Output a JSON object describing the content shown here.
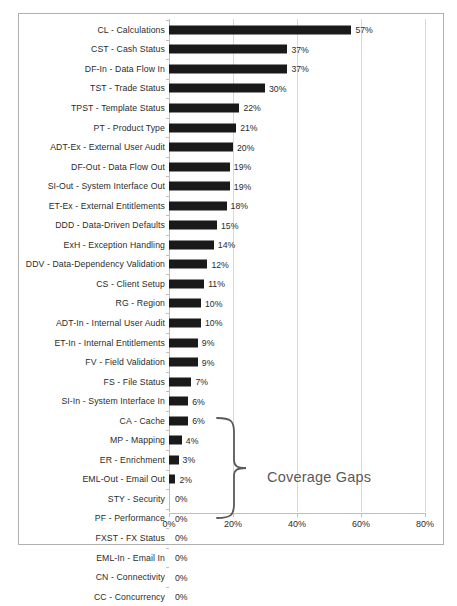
{
  "chart_data": {
    "type": "bar",
    "orientation": "horizontal",
    "title": "",
    "xlabel": "",
    "ylabel": "",
    "xlim": [
      0,
      80
    ],
    "grid": true,
    "legend": false,
    "unit": "%",
    "categories": [
      "CL - Calculations",
      "CST - Cash Status",
      "DF-In - Data Flow In",
      "TST - Trade Status",
      "TPST - Template Status",
      "PT - Product Type",
      "ADT-Ex - External User Audit",
      "DF-Out - Data Flow Out",
      "SI-Out - System Interface Out",
      "ET-Ex - External Entitlements",
      "DDD - Data-Driven Defaults",
      "ExH - Exception Handling",
      "DDV - Data-Dependency Validation",
      "CS - Client Setup",
      "RG - Region",
      "ADT-In - Internal User Audit",
      "ET-In - Internal Entitlements",
      "FV - Field Validation",
      "FS - File Status",
      "SI-In - System Interface In",
      "CA - Cache",
      "MP - Mapping",
      "ER - Enrichment",
      "EML-Out - Email Out",
      "STY - Security",
      "PF - Performance",
      "FXST - FX Status",
      "EML-In - Email In",
      "CN - Connectivity",
      "CC - Concurrency"
    ],
    "values": [
      57,
      37,
      37,
      30,
      22,
      21,
      20,
      19,
      19,
      18,
      15,
      14,
      12,
      11,
      10,
      10,
      9,
      9,
      7,
      6,
      6,
      4,
      3,
      2,
      0,
      0,
      0,
      0,
      0,
      0
    ],
    "data_labels": [
      "57%",
      "37%",
      "37%",
      "30%",
      "22%",
      "21%",
      "20%",
      "19%",
      "19%",
      "18%",
      "15%",
      "14%",
      "12%",
      "11%",
      "10%",
      "10%",
      "9%",
      "9%",
      "7%",
      "6%",
      "6%",
      "4%",
      "3%",
      "2%",
      "0%",
      "0%",
      "0%",
      "0%",
      "0%",
      "0%"
    ],
    "xticks": [
      0,
      20,
      40,
      60,
      80
    ],
    "xtick_labels": [
      "0%",
      "20%",
      "40%",
      "60%",
      "80%"
    ],
    "annotations": [
      {
        "text": "Coverage Gaps",
        "kind": "brace-callout",
        "covers_categories": [
          "STY - Security",
          "PF - Performance",
          "FXST - FX Status",
          "EML-In - Email In",
          "CN - Connectivity",
          "CC - Concurrency"
        ]
      }
    ],
    "colors": {
      "bar": "#1a1a1a",
      "gridline": "#d9d9d9",
      "axis": "#bfbfbf",
      "text": "#2b2b2b",
      "annotation": "#5a5a5a",
      "frame": "#b0b0b0",
      "background": "#ffffff"
    }
  }
}
